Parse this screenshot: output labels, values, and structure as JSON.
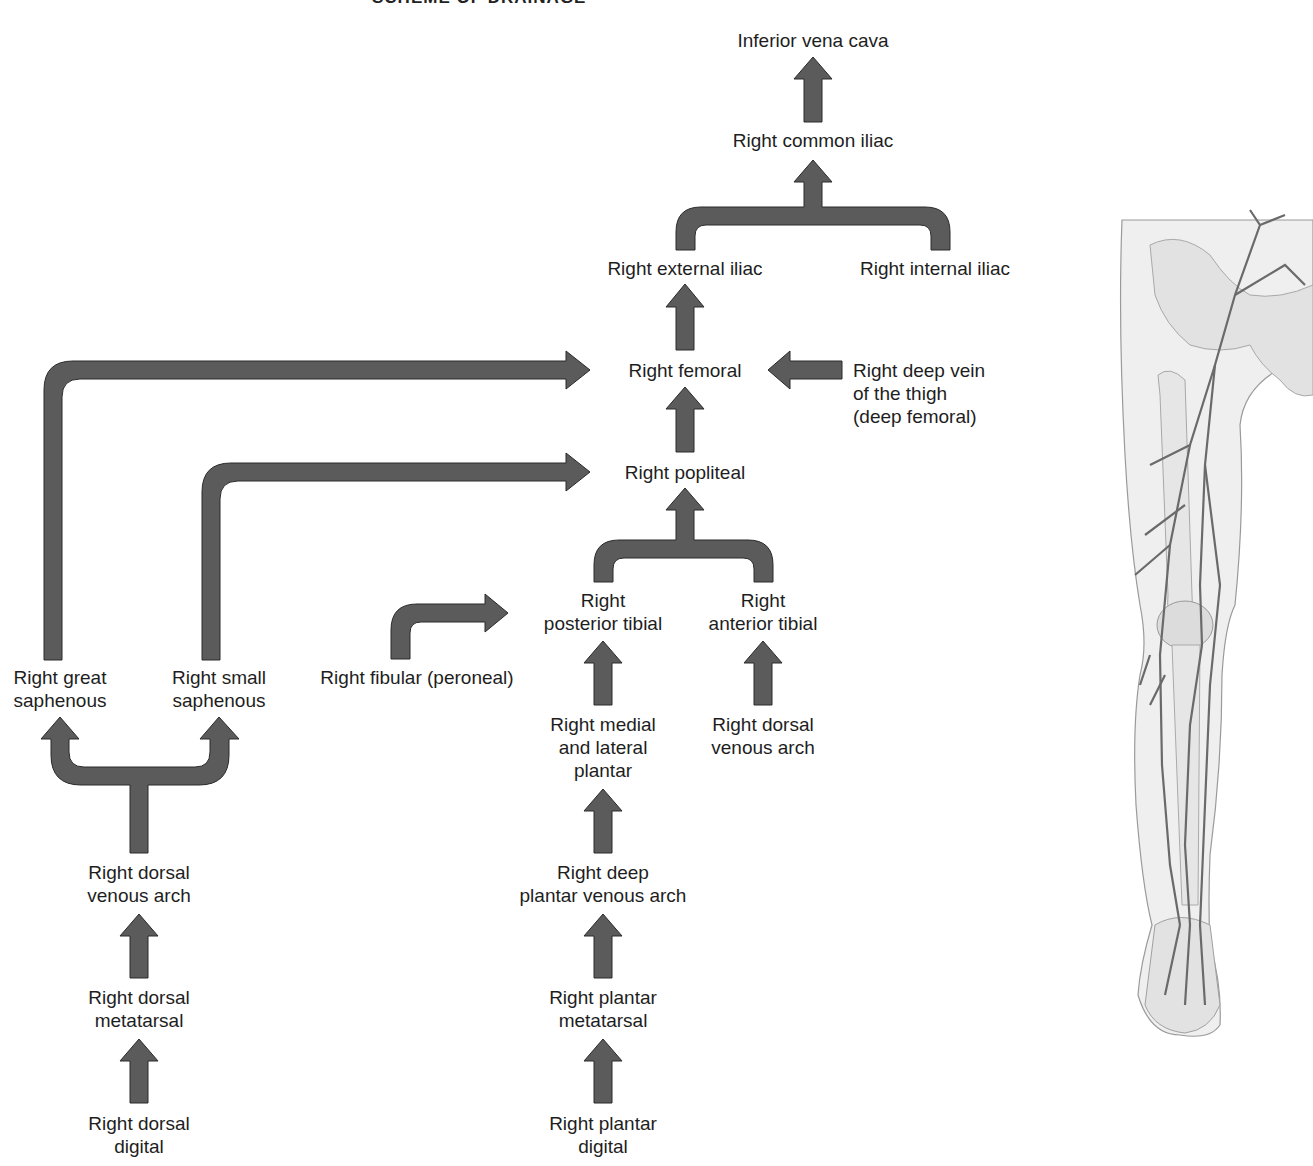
{
  "title": "SCHEME OF DRAINAGE",
  "colors": {
    "arrow_fill": "#5b5b5b",
    "arrow_stroke": "#2a2a2a",
    "text": "#1e1e1e",
    "background": "#ffffff"
  },
  "nodes": {
    "ivc": "Inferior vena cava",
    "common_iliac": "Right common iliac",
    "external_iliac": "Right external iliac",
    "internal_iliac": "Right internal iliac",
    "femoral": "Right femoral",
    "deep_thigh": [
      "Right deep vein",
      "of the thigh",
      "(deep femoral)"
    ],
    "popliteal": "Right popliteal",
    "posterior_tibial": [
      "Right",
      "posterior tibial"
    ],
    "anterior_tibial": [
      "Right",
      "anterior tibial"
    ],
    "fibular": "Right fibular (peroneal)",
    "great_saphenous": [
      "Right great",
      "saphenous"
    ],
    "small_saphenous": [
      "Right small",
      "saphenous"
    ],
    "medial_lateral_plantar": [
      "Right medial",
      "and lateral",
      "plantar"
    ],
    "dorsal_venous_arch_right": [
      "Right dorsal",
      "venous arch"
    ],
    "dorsal_venous_arch_left": [
      "Right dorsal",
      "venous arch"
    ],
    "deep_plantar_arch": [
      "Right deep",
      "plantar venous arch"
    ],
    "dorsal_metatarsal": [
      "Right dorsal",
      "metatarsal"
    ],
    "plantar_metatarsal": [
      "Right plantar",
      "metatarsal"
    ],
    "dorsal_digital": [
      "Right dorsal",
      "digital"
    ],
    "plantar_digital": [
      "Right plantar",
      "digital"
    ]
  },
  "illustration": {
    "subject": "right-leg-venous-anatomy"
  },
  "flows": [
    [
      "Right common iliac",
      "Inferior vena cava"
    ],
    [
      "Right external iliac",
      "Right common iliac"
    ],
    [
      "Right internal iliac",
      "Right common iliac"
    ],
    [
      "Right femoral",
      "Right external iliac"
    ],
    [
      "Right deep vein of the thigh (deep femoral)",
      "Right femoral"
    ],
    [
      "Right great saphenous",
      "Right femoral"
    ],
    [
      "Right popliteal",
      "Right femoral"
    ],
    [
      "Right small saphenous",
      "Right popliteal"
    ],
    [
      "Right posterior tibial",
      "Right popliteal"
    ],
    [
      "Right anterior tibial",
      "Right popliteal"
    ],
    [
      "Right fibular (peroneal)",
      "Right posterior tibial"
    ],
    [
      "Right medial and lateral plantar",
      "Right posterior tibial"
    ],
    [
      "Right dorsal venous arch",
      "Right anterior tibial"
    ],
    [
      "Right deep plantar venous arch",
      "Right medial and lateral plantar"
    ],
    [
      "Right plantar metatarsal",
      "Right deep plantar venous arch"
    ],
    [
      "Right plantar digital",
      "Right plantar metatarsal"
    ],
    [
      "Right dorsal venous arch",
      "Right great saphenous"
    ],
    [
      "Right dorsal venous arch",
      "Right small saphenous"
    ],
    [
      "Right dorsal metatarsal",
      "Right dorsal venous arch"
    ],
    [
      "Right dorsal digital",
      "Right dorsal metatarsal"
    ]
  ]
}
